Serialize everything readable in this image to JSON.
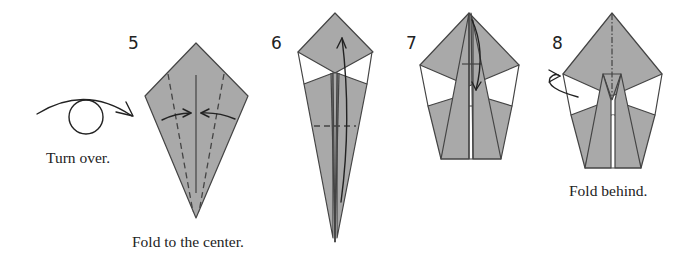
{
  "diagram": {
    "colors": {
      "paper": "#a9a9a9",
      "outline": "#444444",
      "background": "#ffffff"
    },
    "steps": [
      {
        "number": "5",
        "pre_caption": "Turn over.",
        "caption": "Fold to the center.",
        "symbols": [
          "turn-over-arrow",
          "valley-fold-lines",
          "fold-in-arrows"
        ]
      },
      {
        "number": "6",
        "caption": "",
        "symbols": [
          "valley-fold-line",
          "fold-up-arrow"
        ]
      },
      {
        "number": "7",
        "caption": "",
        "symbols": [
          "fold-down-arrow"
        ]
      },
      {
        "number": "8",
        "caption": "Fold behind.",
        "symbols": [
          "mountain-fold-line",
          "fold-behind-arrow"
        ]
      }
    ]
  }
}
